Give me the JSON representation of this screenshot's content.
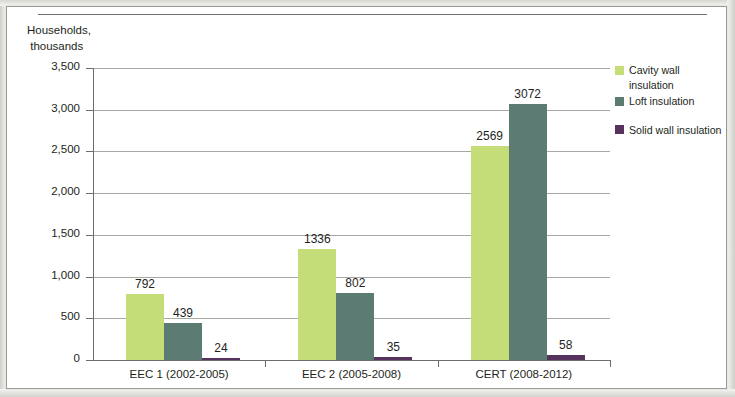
{
  "chart_data": {
    "type": "bar",
    "title": "",
    "subtitle": "",
    "xlabel": "",
    "ylabel": "Households,\n thousands",
    "categories": [
      "EEC 1 (2002-2005)",
      "EEC 2 (2005-2008)",
      "CERT (2008-2012)"
    ],
    "series": [
      {
        "name": "Cavity wall insulation",
        "color": "#c5dd79",
        "values": [
          792,
          1336,
          2569
        ]
      },
      {
        "name": "Loft insulation",
        "color": "#5c7b73",
        "values": [
          439,
          802,
          3072
        ]
      },
      {
        "name": "Solid wall insulation",
        "color": "#55335c",
        "values": [
          24,
          35,
          58
        ]
      }
    ],
    "ylim": [
      0,
      3500
    ],
    "ytick_step": 500,
    "ytick_labels": [
      "0",
      "500",
      "1,000",
      "1,500",
      "2,000",
      "2,500",
      "3,000",
      "3,500"
    ],
    "data_labels": [
      [
        "792",
        "439",
        "24"
      ],
      [
        "1336",
        "802",
        "35"
      ],
      [
        "2569",
        "3072",
        "58"
      ]
    ],
    "grid": "horizontal",
    "legend_position": "right"
  },
  "legend": {
    "items": [
      {
        "label": "Cavity wall insulation",
        "color": "#c5dd79"
      },
      {
        "label": "Loft insulation",
        "color": "#5c7b73"
      },
      {
        "label": "Solid wall insulation",
        "color": "#55335c"
      }
    ]
  }
}
